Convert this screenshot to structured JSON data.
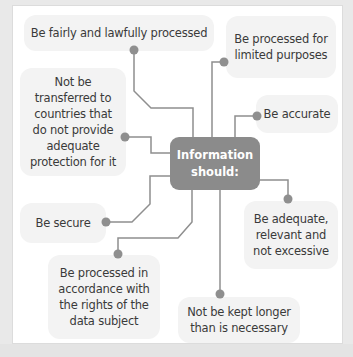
{
  "diagram": {
    "center": {
      "label": "Information\nshould:"
    },
    "principles": [
      {
        "id": "fair",
        "label": "Be fairly and lawfully processed"
      },
      {
        "id": "limited",
        "label": "Be processed for\nlimited purposes"
      },
      {
        "id": "accurate",
        "label": "Be accurate"
      },
      {
        "id": "transfer",
        "label": "Not be\ntransferred to\ncountries that\ndo not provide\nadequate\nprotection for it"
      },
      {
        "id": "adequate",
        "label": "Be adequate,\nrelevant and\nnot excessive"
      },
      {
        "id": "secure",
        "label": "Be secure"
      },
      {
        "id": "rights",
        "label": "Be processed in\naccordance with\nthe rights of the\ndata subject"
      },
      {
        "id": "kept",
        "label": "Not be kept longer\nthan is necessary"
      }
    ],
    "colors": {
      "center_fill": "#8b8b8b",
      "bubble_fill": "#f3f3f3",
      "connector": "#8f8f8f",
      "text": "#3a3a3a"
    }
  }
}
